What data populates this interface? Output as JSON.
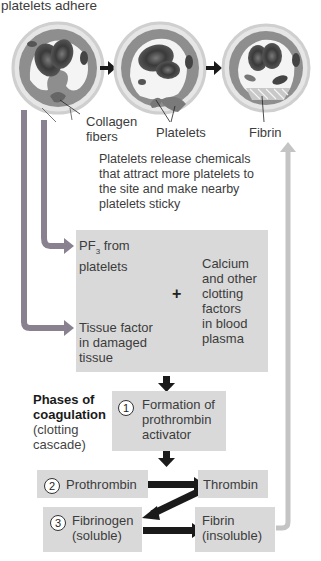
{
  "header": {
    "label": "platelets adhere"
  },
  "illustrations": {
    "stage1": {
      "label_line1": "Collagen",
      "label_line2": "fibers"
    },
    "stage2": {
      "label": "Platelets"
    },
    "stage3": {
      "label": "Fibrin"
    }
  },
  "release_note": {
    "lines": [
      "Platelets release chemicals",
      "that attract more platelets to",
      "the site and make nearby",
      "platelets sticky"
    ]
  },
  "factors_box": {
    "pf3": {
      "prefix": "PF",
      "subscript": "3",
      "suffix": " from",
      "line2": "platelets"
    },
    "tissue_factor": {
      "lines": [
        "Tissue factor",
        "in damaged",
        "tissue"
      ]
    },
    "plus": "+",
    "calcium": {
      "lines": [
        "Calcium",
        "and other",
        "clotting",
        "factors",
        "in blood",
        "plasma"
      ]
    }
  },
  "phases": {
    "title_line1": "Phases of",
    "title_line2": "coagulation",
    "subtitle_line1": "(clotting",
    "subtitle_line2": "cascade)"
  },
  "steps": {
    "step1": {
      "number": "1",
      "lines": [
        "Formation of",
        "prothrombin",
        "activator"
      ]
    },
    "step2": {
      "number": "2",
      "label": "Prothrombin"
    },
    "thrombin": {
      "label": "Thrombin"
    },
    "step3": {
      "number": "3",
      "lines": [
        "Fibrinogen",
        "(soluble)"
      ]
    },
    "fibrin": {
      "lines": [
        "Fibrin",
        "(insoluble)"
      ]
    }
  },
  "colors": {
    "box_fill": "#d9d9d9",
    "left_arrow": "#8a8190",
    "right_feedback_arrow": "#c4c4c4",
    "black_arrow": "#1a1a1a",
    "vessel_wall": "#8c8c8c",
    "rbc": "#4a4a4a"
  }
}
